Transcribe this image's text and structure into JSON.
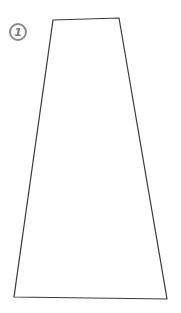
{
  "figure": {
    "label": "1",
    "shape": "trapezoid",
    "stroke_color": "#3a3a3a",
    "badge_color": "#8a8a8a",
    "vertices": {
      "top_left": [
        53,
        20
      ],
      "top_right": [
        119,
        18
      ],
      "bottom_right": [
        167,
        299
      ],
      "bottom_left": [
        14,
        297
      ]
    }
  }
}
